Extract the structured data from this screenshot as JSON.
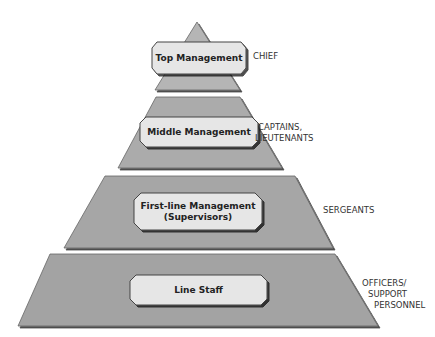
{
  "colors": {
    "tier_fill": "#a9a9a9",
    "box_fill": "#e6e6e6",
    "outline": "#444444"
  },
  "tiers": [
    {
      "level": "Top Management",
      "rank": "CHIEF"
    },
    {
      "level": "Middle Management",
      "rank_line1": "CAPTAINS,",
      "rank_line2": "LIEUTENANTS"
    },
    {
      "level_line1": "First-line Management",
      "level_line2": "(Supervisors)",
      "rank": "SERGEANTS"
    },
    {
      "level": "Line Staff",
      "rank_line1": "OFFICERS/",
      "rank_line2": "SUPPORT",
      "rank_line3": "PERSONNEL"
    }
  ]
}
